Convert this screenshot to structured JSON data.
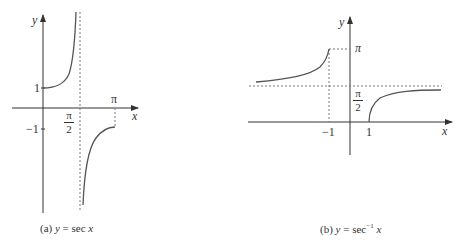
{
  "figure_a": {
    "caption_prefix": "(a) ",
    "caption_y": "y",
    "caption_eq": " = sec ",
    "caption_x": "x",
    "axis_x_label": "x",
    "axis_y_label": "y",
    "tick_y_pos": "1",
    "tick_y_neg": "−1",
    "tick_pi": "π",
    "tick_pi_half_num": "π",
    "tick_pi_half_den": "2"
  },
  "figure_b": {
    "caption_prefix": "(b)  ",
    "caption_y": "y",
    "caption_eq": " = sec",
    "caption_sup": "−1",
    "caption_x": " x",
    "axis_x_label": "x",
    "axis_y_label": "y",
    "tick_x_neg": "−1",
    "tick_x_pos": "1",
    "tick_pi": "π",
    "tick_pi_half_num": "π",
    "tick_pi_half_den": "2"
  },
  "colors": {
    "curve": "#555555",
    "axis": "#333333",
    "dash": "#666666"
  }
}
